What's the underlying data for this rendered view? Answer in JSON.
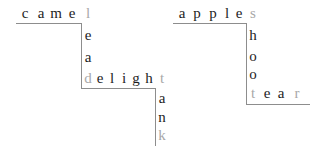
{
  "puzzle": {
    "type": "word-staircase",
    "canvas": {
      "width": 320,
      "height": 146,
      "background": "#ffffff"
    },
    "colors": {
      "letter": "#1d1d1d",
      "shared_letter": "#a8a8a8",
      "rule": "#8d8d8d"
    },
    "words": [
      {
        "id": "camel",
        "text": "camel",
        "orientation": "horizontal",
        "letters": [
          {
            "char": "c",
            "shared": false,
            "x": 18,
            "y": 5
          },
          {
            "char": "a",
            "shared": false,
            "x": 34,
            "y": 5
          },
          {
            "char": "m",
            "shared": false,
            "x": 49,
            "y": 5
          },
          {
            "char": "e",
            "shared": false,
            "x": 65,
            "y": 5
          },
          {
            "char": "l",
            "shared": true,
            "x": 81,
            "y": 5
          }
        ]
      },
      {
        "id": "lead",
        "text": "lead",
        "orientation": "vertical",
        "letters": [
          {
            "char": "l",
            "shared": true,
            "x": 81,
            "y": 5
          },
          {
            "char": "e",
            "shared": false,
            "x": 81,
            "y": 27
          },
          {
            "char": "a",
            "shared": false,
            "x": 81,
            "y": 49
          },
          {
            "char": "d",
            "shared": true,
            "x": 81,
            "y": 70
          }
        ]
      },
      {
        "id": "delight",
        "text": "delight",
        "orientation": "horizontal",
        "letters": [
          {
            "char": "d",
            "shared": true,
            "x": 81,
            "y": 70
          },
          {
            "char": "e",
            "shared": false,
            "x": 93,
            "y": 70
          },
          {
            "char": "l",
            "shared": false,
            "x": 105,
            "y": 70
          },
          {
            "char": "i",
            "shared": false,
            "x": 117,
            "y": 70
          },
          {
            "char": "g",
            "shared": false,
            "x": 129,
            "y": 70
          },
          {
            "char": "h",
            "shared": false,
            "x": 142,
            "y": 70
          },
          {
            "char": "t",
            "shared": true,
            "x": 155,
            "y": 70
          }
        ]
      },
      {
        "id": "tank",
        "text": "tank",
        "orientation": "vertical",
        "letters": [
          {
            "char": "t",
            "shared": true,
            "x": 155,
            "y": 70
          },
          {
            "char": "a",
            "shared": false,
            "x": 155,
            "y": 90
          },
          {
            "char": "n",
            "shared": false,
            "x": 155,
            "y": 109
          },
          {
            "char": "k",
            "shared": true,
            "x": 155,
            "y": 127
          }
        ]
      },
      {
        "id": "apples",
        "text": "apples",
        "orientation": "horizontal",
        "letters": [
          {
            "char": "a",
            "shared": false,
            "x": 175,
            "y": 5
          },
          {
            "char": "p",
            "shared": false,
            "x": 190,
            "y": 5
          },
          {
            "char": "p",
            "shared": false,
            "x": 206,
            "y": 5
          },
          {
            "char": "l",
            "shared": false,
            "x": 220,
            "y": 5
          },
          {
            "char": "e",
            "shared": false,
            "x": 232,
            "y": 5
          },
          {
            "char": "s",
            "shared": true,
            "x": 246,
            "y": 5
          }
        ]
      },
      {
        "id": "shoot",
        "text": "shoot",
        "orientation": "vertical",
        "letters": [
          {
            "char": "s",
            "shared": true,
            "x": 246,
            "y": 5
          },
          {
            "char": "h",
            "shared": false,
            "x": 246,
            "y": 27
          },
          {
            "char": "o",
            "shared": false,
            "x": 246,
            "y": 48
          },
          {
            "char": "o",
            "shared": false,
            "x": 246,
            "y": 66
          },
          {
            "char": "t",
            "shared": true,
            "x": 246,
            "y": 85
          }
        ]
      },
      {
        "id": "tear",
        "text": "tear",
        "orientation": "horizontal",
        "letters": [
          {
            "char": "t",
            "shared": true,
            "x": 246,
            "y": 85
          },
          {
            "char": "e",
            "shared": false,
            "x": 260,
            "y": 85
          },
          {
            "char": "a",
            "shared": false,
            "x": 274,
            "y": 85
          },
          {
            "char": "r",
            "shared": true,
            "x": 290,
            "y": 85
          }
        ]
      }
    ],
    "rules": [
      {
        "id": "rule-under-camel",
        "kind": "h",
        "x": 16,
        "y": 23,
        "length": 66
      },
      {
        "id": "rule-left-of-lead",
        "kind": "v",
        "x": 81,
        "y": 23,
        "length": 65
      },
      {
        "id": "rule-under-delight",
        "kind": "h",
        "x": 81,
        "y": 88,
        "length": 75
      },
      {
        "id": "rule-left-of-tank",
        "kind": "v",
        "x": 155,
        "y": 88,
        "length": 58
      },
      {
        "id": "rule-under-apples",
        "kind": "h",
        "x": 173,
        "y": 23,
        "length": 74
      },
      {
        "id": "rule-left-of-shoot",
        "kind": "v",
        "x": 246,
        "y": 23,
        "length": 81
      },
      {
        "id": "rule-under-tear",
        "kind": "h",
        "x": 246,
        "y": 104,
        "length": 64
      }
    ]
  }
}
